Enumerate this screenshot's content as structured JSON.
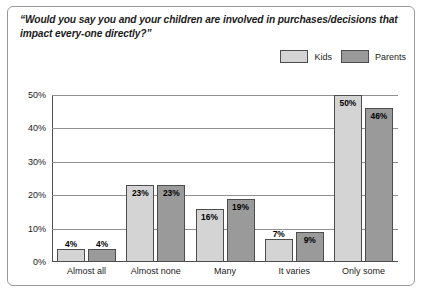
{
  "title": "“Would you say you and your children are involved in purchases/decisions that impact every-one directly?”",
  "legend": [
    {
      "label": "Kids",
      "color": "#d4d4d4"
    },
    {
      "label": "Parents",
      "color": "#9a9a9a"
    }
  ],
  "chart_data": {
    "type": "bar",
    "title": "“Would you say you and your children are involved in purchases/decisions that impact every-one directly?”",
    "xlabel": "",
    "ylabel": "",
    "ylim": [
      0,
      50
    ],
    "yticks": [
      "0%",
      "10%",
      "20%",
      "30%",
      "40%",
      "50%"
    ],
    "ytick_values": [
      0,
      10,
      20,
      30,
      40,
      50
    ],
    "grid": true,
    "legend_position": "top-right",
    "categories": [
      "Almost all",
      "Almost none",
      "Many",
      "It varies",
      "Only some"
    ],
    "series": [
      {
        "name": "Kids",
        "color": "#d4d4d4",
        "values": [
          4,
          23,
          16,
          7,
          50
        ],
        "labels": [
          "4%",
          "23%",
          "16%",
          "7%",
          "50%"
        ]
      },
      {
        "name": "Parents",
        "color": "#9a9a9a",
        "values": [
          4,
          23,
          19,
          9,
          46
        ],
        "labels": [
          "4%",
          "23%",
          "19%",
          "9%",
          "46%"
        ]
      }
    ]
  }
}
